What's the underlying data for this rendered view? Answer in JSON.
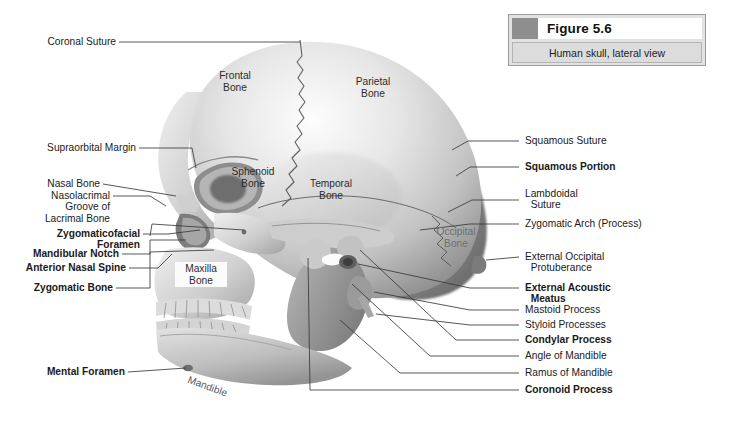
{
  "figure": {
    "swatch_color": "#8e8e8e",
    "title": "Figure 5.6",
    "subtitle": "Human skull, lateral view"
  },
  "labels_left": [
    {
      "name": "coronal-suture",
      "text": "Coronal Suture",
      "bold": false
    },
    {
      "name": "supraorbital-margin",
      "text": "Supraorbital Margin",
      "bold": false
    },
    {
      "name": "nasal-bone",
      "text": "Nasal Bone",
      "bold": false
    },
    {
      "name": "nasolacrimal-groove",
      "text": "Nasolacrimal\nGroove of\nLacrimal Bone",
      "bold": false
    },
    {
      "name": "zygomaticofacial-foramen",
      "text": "Zygomaticofacial\nForamen",
      "bold": true
    },
    {
      "name": "mandibular-notch",
      "text": "Mandibular Notch",
      "bold": true
    },
    {
      "name": "anterior-nasal-spine",
      "text": "Anterior Nasal Spine",
      "bold": true
    },
    {
      "name": "zygomatic-bone",
      "text": "Zygomatic Bone",
      "bold": true
    },
    {
      "name": "mental-foramen",
      "text": "Mental Foramen",
      "bold": true
    }
  ],
  "labels_right": [
    {
      "name": "squamous-suture",
      "text": "Squamous Suture",
      "bold": false
    },
    {
      "name": "squamous-portion",
      "text": "Squamous Portion",
      "bold": true
    },
    {
      "name": "lambdoidal-suture",
      "text": "Lambdoidal\n  Suture",
      "bold": false
    },
    {
      "name": "zygomatic-arch",
      "text": "Zygomatic Arch (Process)",
      "bold": false
    },
    {
      "name": "external-occipital-protuberance",
      "text": "External Occipital\n  Protuberance",
      "bold": false
    },
    {
      "name": "external-acoustic-meatus",
      "text": "External Acoustic\n  Meatus",
      "bold": true
    },
    {
      "name": "mastoid-process",
      "text": "Mastoid Process",
      "bold": false
    },
    {
      "name": "styloid-processes",
      "text": "Styloid Processes",
      "bold": false
    },
    {
      "name": "condylar-process",
      "text": "Condylar Process",
      "bold": true
    },
    {
      "name": "angle-of-mandible",
      "text": "Angle of Mandible",
      "bold": false
    },
    {
      "name": "ramus-of-mandible",
      "text": "Ramus of Mandible",
      "bold": false
    },
    {
      "name": "coronoid-process",
      "text": "Coronoid Process",
      "bold": true
    }
  ],
  "bone_names": [
    {
      "name": "frontal-bone",
      "text": "Frontal\nBone"
    },
    {
      "name": "parietal-bone",
      "text": "Parietal\nBone"
    },
    {
      "name": "sphenoid-bone",
      "text": "Sphenoid\nBone"
    },
    {
      "name": "temporal-bone",
      "text": "Temporal\nBone"
    },
    {
      "name": "occipital-bone",
      "text": "Occipital\nBone"
    },
    {
      "name": "maxilla-bone",
      "text": "Maxilla\nBone"
    },
    {
      "name": "mandible-bone",
      "text": "Mandible"
    }
  ]
}
